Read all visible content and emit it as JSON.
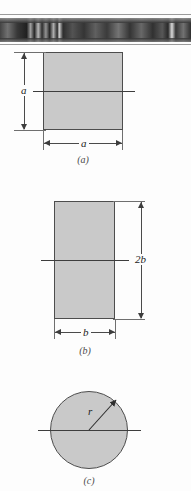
{
  "document": {
    "type": "textbook-figure",
    "description": "Three cross-section diagrams with horizontal centroidal axes",
    "shading_color": "#c9c9c9",
    "outline_color": "#4d4d4d",
    "background_color": "#fdfdfd"
  },
  "scan_artifact": {
    "name": "scanned-strip",
    "alt": "dark partially scanned image strip"
  },
  "figures": [
    {
      "id": "a",
      "caption": "(a)",
      "shape": "square",
      "axis": "horizontal centroidal axis",
      "dimensions": [
        {
          "name": "height",
          "label": "a",
          "orientation": "vertical",
          "side": "left"
        },
        {
          "name": "width",
          "label": "a",
          "orientation": "horizontal",
          "side": "bottom"
        }
      ]
    },
    {
      "id": "b",
      "caption": "(b)",
      "shape": "rectangle",
      "axis": "horizontal centroidal axis",
      "dimensions": [
        {
          "name": "height",
          "label": "2b",
          "orientation": "vertical",
          "side": "right"
        },
        {
          "name": "width",
          "label": "b",
          "orientation": "horizontal",
          "side": "bottom"
        }
      ]
    },
    {
      "id": "c",
      "caption": "(c)",
      "shape": "circle",
      "axis": "horizontal centroidal axis",
      "dimensions": [
        {
          "name": "radius",
          "label": "r",
          "orientation": "radial",
          "side": "upper-right"
        }
      ]
    }
  ]
}
